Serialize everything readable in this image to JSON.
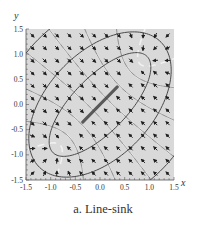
{
  "caption": "a. Line-sink",
  "colors": {
    "plot_background": "#d9d9d9",
    "contour": "#4a4a4a",
    "arrow": "#1e1e1e",
    "streamline_highlight": "#f4f4f4",
    "sink": "#3a3a3a",
    "axis": "#555555",
    "text": "#333333"
  },
  "chart_data": {
    "type": "vector_field",
    "title": "a. Line-sink",
    "xlabel": "x",
    "ylabel": "y",
    "xlim": [
      -1.5,
      1.5
    ],
    "ylim": [
      -1.5,
      1.5
    ],
    "x_ticks": [
      "-1.5",
      "-1.0",
      "-0.5",
      "0.0",
      "0.5",
      "1.0",
      "1.5"
    ],
    "y_ticks": [
      "-1.5",
      "-1.0",
      "-0.5",
      "0.0",
      "0.5",
      "1.0",
      "1.5"
    ],
    "x_tick_values": [
      -1.5,
      -1.0,
      -0.5,
      0.0,
      0.5,
      1.0,
      1.5
    ],
    "y_tick_values": [
      -1.5,
      -1.0,
      -0.5,
      0.0,
      0.5,
      1.0,
      1.5
    ],
    "minor_tick_step": 0.1,
    "line_sink": {
      "start": [
        -0.85,
        -0.85
      ],
      "end": [
        0.85,
        0.85
      ]
    },
    "field_grid": {
      "start": -1.375,
      "step": 0.25,
      "count": 12
    },
    "contour_ellipses": [
      {
        "semi_major": 1.35,
        "semi_minor": 0.55
      },
      {
        "semi_major": 1.75,
        "semi_minor": 1.05
      },
      {
        "semi_major": 2.35,
        "semi_minor": 1.8
      }
    ],
    "orthogonal_hyperbolas": [
      -0.75,
      -0.45,
      -0.15,
      0.15,
      0.45,
      0.75
    ],
    "grid": false
  }
}
